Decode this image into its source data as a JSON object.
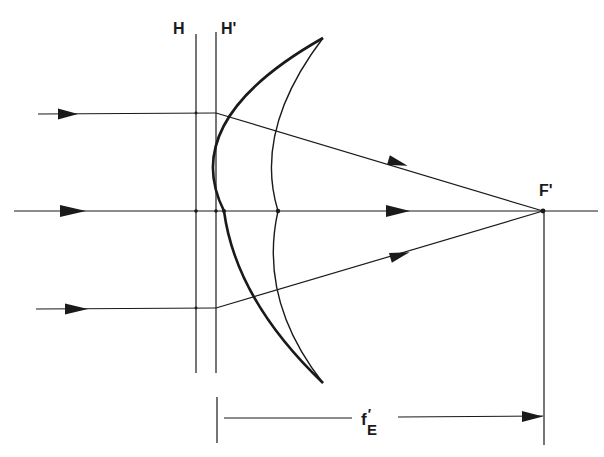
{
  "diagram": {
    "type": "optical ray diagram",
    "labels": {
      "principal_plane_front": "H",
      "principal_plane_rear": "H'",
      "focal_point": "F'",
      "focal_length_main": "f",
      "focal_length_prime": "′",
      "focal_length_sub": "E"
    },
    "colors": {
      "ink": "#1a1a1a",
      "background": "#ffffff"
    },
    "elements": {
      "rays": [
        {
          "name": "upper-ray",
          "y_in": 113,
          "refracts_at_x": 215,
          "ends_at": "F'"
        },
        {
          "name": "axial-ray",
          "y_in": 211,
          "refracts_at_x": null,
          "ends_at": "F'"
        },
        {
          "name": "lower-ray",
          "y_in": 308,
          "refracts_at_x": 215,
          "ends_at": "F'"
        }
      ],
      "optical_axis_y": 211,
      "plane_H_x": 196,
      "plane_H_prime_x": 216,
      "focal_point_x": 543
    }
  }
}
